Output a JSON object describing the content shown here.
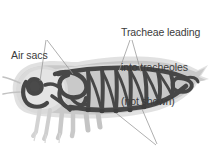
{
  "figure": {
    "background_color": "#ffffff",
    "text_color": "#3b3b3b"
  },
  "labels": {
    "air_sacs": {
      "text": "Air sacs",
      "name": "air-sacs-label"
    },
    "tracheae": {
      "line1": "Tracheae leading",
      "line2": "into tracheoles",
      "line3": "(not shown)",
      "name": "tracheae-label"
    },
    "spiracles": {
      "text": "Spiracles",
      "name": "spiracles-label"
    }
  },
  "colors": {
    "body_outline_halo": "#d6d6d6",
    "body_fill_light": "#e3e3e3",
    "body_fill_mid": "#c4c4c4",
    "body_fill_dark": "#b0b0b0",
    "trachea_dark": "#4a4a4a",
    "trachea_darker": "#3d3d3d",
    "leader_line": "#8a8a8a",
    "text": "#3b3b3b"
  },
  "anatomy": {
    "parts": [
      "head",
      "thorax",
      "abdomen",
      "legs",
      "air-sacs",
      "longitudinal-tracheal-trunk",
      "transverse-tracheal-commissures",
      "spiracles"
    ]
  }
}
